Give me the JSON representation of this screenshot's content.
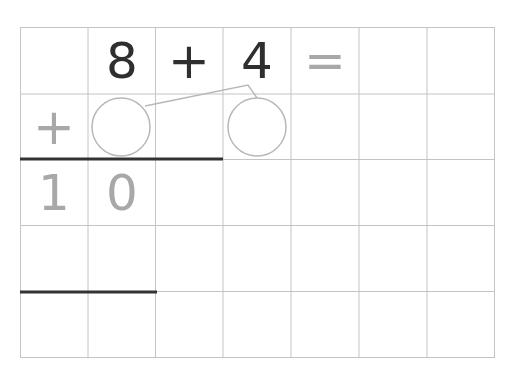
{
  "worksheet": {
    "grid": {
      "columns": 7,
      "rows": 5,
      "left": 20,
      "top": 27,
      "right": 494,
      "bottom": 357,
      "line_color": "#c4c4c4"
    },
    "equation": {
      "first_operand": "8",
      "operator": "+",
      "second_operand": "4",
      "equals": "="
    },
    "decomposition": {
      "sign": "+",
      "blank_circle_1": "",
      "blank_circle_2": ""
    },
    "result_row": {
      "tens": "1",
      "ones": "0"
    },
    "colors": {
      "ink_dark": "#2f2f2f",
      "ink_gray": "#a8a8a8",
      "rule_line": "#333333",
      "circle_stroke": "#b8b8b8"
    }
  }
}
